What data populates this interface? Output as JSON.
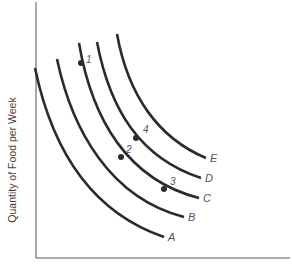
{
  "chart_data": {
    "type": "line",
    "title": "",
    "xlabel": "",
    "ylabel": "Quantity of Food per Week",
    "grid": false,
    "legend": "none (curves labeled inline at right ends)",
    "axis_ticks": "none",
    "series": [
      {
        "name": "A",
        "points": [
          [
            35,
            68
          ],
          [
            48,
            130
          ],
          [
            80,
            190
          ],
          [
            120,
            222
          ],
          [
            164,
            237
          ]
        ]
      },
      {
        "name": "B",
        "points": [
          [
            57,
            59
          ],
          [
            70,
            118
          ],
          [
            100,
            170
          ],
          [
            140,
            202
          ],
          [
            184,
            217
          ]
        ]
      },
      {
        "name": "C",
        "points": [
          [
            79,
            43
          ],
          [
            92,
            100
          ],
          [
            121,
            157
          ],
          [
            164,
            190
          ],
          [
            199,
            198
          ]
        ]
      },
      {
        "name": "D",
        "points": [
          [
            97,
            42
          ],
          [
            108,
            92
          ],
          [
            136,
            138
          ],
          [
            170,
            166
          ],
          [
            201,
            178
          ]
        ]
      },
      {
        "name": "E",
        "points": [
          [
            117,
            34
          ],
          [
            127,
            80
          ],
          [
            152,
            118
          ],
          [
            180,
            142
          ],
          [
            206,
            158
          ]
        ]
      }
    ],
    "labeled_points": [
      {
        "label": "1",
        "curve": "C",
        "x": 80,
        "y": 64
      },
      {
        "label": "2",
        "curve": "C",
        "x": 121,
        "y": 157
      },
      {
        "label": "3",
        "curve": "C",
        "x": 164,
        "y": 190
      },
      {
        "label": "4",
        "curve": "D",
        "x": 136,
        "y": 138
      }
    ],
    "coordinate_note": "points are in screenshot pixel coordinates (y downward)"
  },
  "axes": {
    "y_label": "Quantity of Food per Week"
  },
  "curves": [
    {
      "id": "A",
      "label": "A",
      "path": "M35,68 C50,140 85,210 164,237",
      "label_x": 168,
      "label_y": 241
    },
    {
      "id": "B",
      "label": "B",
      "path": "M57,59 C72,130 110,198 184,217",
      "label_x": 188,
      "label_y": 221
    },
    {
      "id": "C",
      "label": "C",
      "path": "M79,43 C92,120 128,180 199,198",
      "label_x": 203,
      "label_y": 202
    },
    {
      "id": "D",
      "label": "D",
      "path": "M97,42 C110,110 140,158 201,178",
      "label_x": 205,
      "label_y": 182
    },
    {
      "id": "E",
      "label": "E",
      "path": "M117,34 C128,95 158,138 206,158",
      "label_x": 210,
      "label_y": 162
    }
  ],
  "points": [
    {
      "label": "1",
      "cx": 81,
      "cy": 63,
      "lx": 86,
      "ly": 63
    },
    {
      "label": "2",
      "cx": 121,
      "cy": 157,
      "lx": 126,
      "ly": 153
    },
    {
      "label": "3",
      "cx": 164,
      "cy": 189,
      "lx": 170,
      "ly": 185
    },
    {
      "label": "4",
      "cx": 136,
      "cy": 138,
      "lx": 143,
      "ly": 133
    }
  ]
}
